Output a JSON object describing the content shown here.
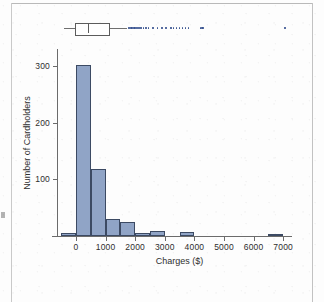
{
  "figure": {
    "caption_present": false
  },
  "chart_data": {
    "type": "bar",
    "title": "",
    "subtitle": "",
    "xlabel": "Charges ($)",
    "ylabel": "Number of Cardholders",
    "xlim": [
      -800,
      7300
    ],
    "ylim": [
      0,
      330
    ],
    "xticks": [
      0,
      1000,
      2000,
      3000,
      4000,
      5000,
      6000,
      7000
    ],
    "xtick_labels": [
      "0",
      "1000",
      "2000",
      "3000",
      "4000",
      "5000",
      "6000",
      "7000"
    ],
    "yticks": [
      100,
      200,
      300
    ],
    "ytick_labels": [
      "100",
      "200",
      "300"
    ],
    "grid": false,
    "legend": null,
    "bin_width": 500,
    "bin_edges": [
      -500,
      0,
      500,
      1000,
      1500,
      2000,
      2500,
      3000,
      3500,
      4000,
      6500,
      7000
    ],
    "bins": [
      {
        "left": -500,
        "right": 0,
        "count": 5
      },
      {
        "left": 0,
        "right": 500,
        "count": 302
      },
      {
        "left": 500,
        "right": 1000,
        "count": 118
      },
      {
        "left": 1000,
        "right": 1500,
        "count": 30
      },
      {
        "left": 1500,
        "right": 2000,
        "count": 24
      },
      {
        "left": 2000,
        "right": 2500,
        "count": 5
      },
      {
        "left": 2500,
        "right": 3000,
        "count": 9
      },
      {
        "left": 3500,
        "right": 4000,
        "count": 7
      },
      {
        "left": 6500,
        "right": 7000,
        "count": 4
      }
    ],
    "categories": [
      "-500",
      "0",
      "500",
      "1000",
      "1500",
      "2000",
      "2500",
      "3500",
      "6500"
    ],
    "values": [
      5,
      302,
      118,
      30,
      24,
      5,
      9,
      7,
      4
    ],
    "colors": {
      "bar_fill": "#90a4c6",
      "bar_edge": "#3c4a63",
      "axis": "#6b6b6b",
      "text": "#2e2e2e",
      "outlier_dot": "#35508e",
      "box_edge": "#5c5c5c"
    },
    "boxplot": {
      "orientation": "horizontal",
      "whisker_low": -400,
      "q1": -50,
      "median": 420,
      "q3": 1070,
      "whisker_high": 1730,
      "outliers": [
        1800,
        1850,
        1900,
        1950,
        2000,
        2060,
        2120,
        2200,
        2280,
        2360,
        2450,
        2600,
        2750,
        2900,
        3050,
        3200,
        3300,
        3400,
        3500,
        3600,
        3700,
        3800,
        4200,
        4250,
        4300,
        7070
      ]
    }
  }
}
